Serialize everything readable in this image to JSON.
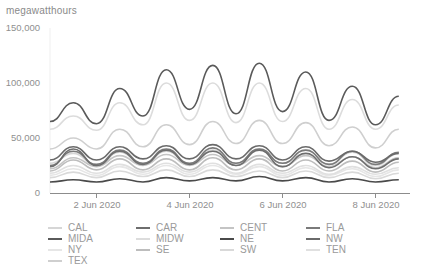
{
  "chart_data": {
    "type": "line",
    "title": "",
    "ylabel": "megawatthours",
    "xlabel": "",
    "ylim": [
      0,
      150000
    ],
    "yticks": [
      0,
      50000,
      100000,
      150000
    ],
    "ytick_labels": [
      "0",
      "50,000",
      "100,000",
      "150,000"
    ],
    "xticks": [
      "2 Jun 2020",
      "4 Jun 2020",
      "6 Jun 2020",
      "8 Jun 2020"
    ],
    "x_unit": "day (June 2020)",
    "x": [
      1.0,
      1.5,
      2.0,
      2.5,
      3.0,
      3.5,
      4.0,
      4.5,
      5.0,
      5.5,
      6.0,
      6.5,
      7.0,
      7.5,
      8.0,
      8.5
    ],
    "grid": false,
    "legend_position": "bottom",
    "series": [
      {
        "name": "CAL",
        "color": "#d6d6d6",
        "values": [
          27000,
          36000,
          25000,
          37000,
          26000,
          38000,
          26000,
          39000,
          27000,
          40000,
          27000,
          39000,
          26000,
          37000,
          25000,
          36000
        ]
      },
      {
        "name": "CAR",
        "color": "#6e6e6e",
        "values": [
          24000,
          40000,
          25000,
          38000,
          26000,
          39000,
          26000,
          38000,
          25000,
          39000,
          24000,
          36000,
          23000,
          33000,
          22000,
          31000
        ]
      },
      {
        "name": "CENT",
        "color": "#c4c4c4",
        "values": [
          22000,
          32000,
          24000,
          34000,
          25000,
          35000,
          25000,
          35000,
          25000,
          34000,
          24000,
          34000,
          24000,
          33000,
          23000,
          32000
        ]
      },
      {
        "name": "FLA",
        "color": "#7a7a7a",
        "values": [
          25000,
          38000,
          26000,
          39000,
          27000,
          40000,
          27000,
          41000,
          27000,
          40000,
          27000,
          39000,
          26000,
          38000,
          26000,
          37000
        ]
      },
      {
        "name": "MIDA",
        "color": "#5a5a5a",
        "values": [
          65000,
          82000,
          63000,
          95000,
          70000,
          112000,
          76000,
          116000,
          72000,
          118000,
          74000,
          110000,
          66000,
          97000,
          62000,
          88000
        ]
      },
      {
        "name": "MIDW",
        "color": "#dcdcdc",
        "values": [
          58000,
          70000,
          57000,
          82000,
          62000,
          100000,
          66000,
          100000,
          64000,
          100000,
          65000,
          95000,
          58000,
          85000,
          58000,
          80000
        ]
      },
      {
        "name": "NE",
        "color": "#4a4a4a",
        "values": [
          10000,
          12000,
          10000,
          13000,
          10000,
          14000,
          11000,
          14000,
          11000,
          15000,
          11000,
          14000,
          10000,
          13000,
          10000,
          12000
        ]
      },
      {
        "name": "NW",
        "color": "#6a6a6a",
        "values": [
          30000,
          42000,
          30000,
          42000,
          31000,
          43000,
          31000,
          44000,
          31000,
          43000,
          30000,
          42000,
          29000,
          38000,
          28000,
          36000
        ]
      },
      {
        "name": "NY",
        "color": "#e6e6e6",
        "values": [
          16000,
          22000,
          16000,
          24000,
          17000,
          25000,
          17000,
          25000,
          17000,
          24000,
          16000,
          23000,
          16000,
          22000,
          15000,
          21000
        ]
      },
      {
        "name": "SE",
        "color": "#bdbdbd",
        "values": [
          20000,
          30000,
          21000,
          31000,
          21000,
          31000,
          21000,
          32000,
          21000,
          31000,
          20000,
          30000,
          20000,
          29000,
          19000,
          28000
        ]
      },
      {
        "name": "SW",
        "color": "#d9d9d9",
        "values": [
          14000,
          19000,
          14000,
          20000,
          15000,
          21000,
          15000,
          21000,
          15000,
          20000,
          14000,
          20000,
          14000,
          19000,
          13000,
          18000
        ]
      },
      {
        "name": "TEN",
        "color": "#e0e0e0",
        "values": [
          18000,
          25000,
          18000,
          26000,
          19000,
          27000,
          19000,
          27000,
          18000,
          26000,
          18000,
          25000,
          17000,
          24000,
          17000,
          23000
        ]
      },
      {
        "name": "TEX",
        "color": "#cfcfcf",
        "values": [
          40000,
          50000,
          40000,
          58000,
          42000,
          62000,
          44000,
          65000,
          45000,
          66000,
          45000,
          64000,
          43000,
          60000,
          41000,
          58000
        ]
      }
    ]
  },
  "axis": {
    "y_title": "megawatthours",
    "y_labels": [
      "150,000",
      "100,000",
      "50,000",
      "0"
    ],
    "x_labels": [
      "2 Jun 2020",
      "4 Jun 2020",
      "6 Jun 2020",
      "8 Jun 2020"
    ]
  },
  "legend": [
    {
      "label": "CAL",
      "color": "#d6d6d6"
    },
    {
      "label": "CAR",
      "color": "#6e6e6e"
    },
    {
      "label": "CENT",
      "color": "#c4c4c4"
    },
    {
      "label": "FLA",
      "color": "#7a7a7a"
    },
    {
      "label": "MIDA",
      "color": "#5a5a5a"
    },
    {
      "label": "MIDW",
      "color": "#dcdcdc"
    },
    {
      "label": "NE",
      "color": "#4a4a4a"
    },
    {
      "label": "NW",
      "color": "#6a6a6a"
    },
    {
      "label": "NY",
      "color": "#e6e6e6"
    },
    {
      "label": "SE",
      "color": "#bdbdbd"
    },
    {
      "label": "SW",
      "color": "#d9d9d9"
    },
    {
      "label": "TEN",
      "color": "#e0e0e0"
    },
    {
      "label": "TEX",
      "color": "#cfcfcf"
    }
  ]
}
